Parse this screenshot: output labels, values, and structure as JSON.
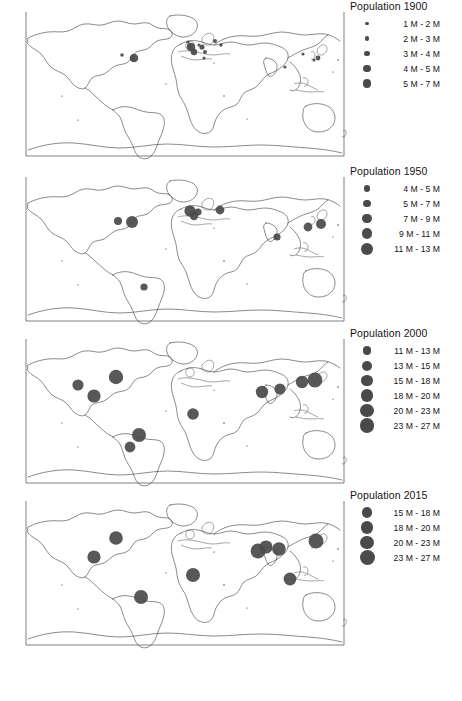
{
  "figure": {
    "type": "proportional-symbol-map-series",
    "panel_count": 4,
    "projection": "world-outline"
  },
  "panels": [
    {
      "id": "panel-1900",
      "legend": {
        "title": "Population 1900",
        "classes": [
          {
            "label": "1 M - 2 M",
            "radius_px": 1.6,
            "min_millions": 1,
            "max_millions": 2
          },
          {
            "label": "2 M - 3 M",
            "radius_px": 2.2,
            "min_millions": 2,
            "max_millions": 3
          },
          {
            "label": "3 M - 4 M",
            "radius_px": 2.9,
            "min_millions": 3,
            "max_millions": 4
          },
          {
            "label": "4 M - 5 M",
            "radius_px": 3.6,
            "min_millions": 4,
            "max_millions": 5
          },
          {
            "label": "5 M - 7 M",
            "radius_px": 4.3,
            "min_millions": 5,
            "max_millions": 7
          }
        ]
      },
      "cities": [
        {
          "name": "New York",
          "x": 116,
          "y": 58,
          "r": 4.3
        },
        {
          "name": "Chicago",
          "x": 104,
          "y": 55,
          "r": 1.8
        },
        {
          "name": "Philadelphia",
          "x": 114,
          "y": 59,
          "r": 1.8
        },
        {
          "name": "London",
          "x": 173,
          "y": 47,
          "r": 4.3
        },
        {
          "name": "Paris",
          "x": 176,
          "y": 52,
          "r": 3.2
        },
        {
          "name": "Berlin",
          "x": 184,
          "y": 47,
          "r": 2.6
        },
        {
          "name": "Vienna",
          "x": 187,
          "y": 52,
          "r": 2.0
        },
        {
          "name": "Saint Petersburg",
          "x": 197,
          "y": 41,
          "r": 2.0
        },
        {
          "name": "Moscow",
          "x": 203,
          "y": 45,
          "r": 1.7
        },
        {
          "name": "Manchester",
          "x": 171,
          "y": 45,
          "r": 1.6
        },
        {
          "name": "Birmingham",
          "x": 172,
          "y": 47,
          "r": 1.6
        },
        {
          "name": "Glasgow",
          "x": 170,
          "y": 42,
          "r": 1.6
        },
        {
          "name": "Hamburg",
          "x": 181,
          "y": 45,
          "r": 1.6
        },
        {
          "name": "Naples",
          "x": 186,
          "y": 58,
          "r": 1.6
        },
        {
          "name": "Tokyo",
          "x": 300,
          "y": 58,
          "r": 2.4
        },
        {
          "name": "Osaka",
          "x": 296,
          "y": 60,
          "r": 1.6
        },
        {
          "name": "Beijing",
          "x": 285,
          "y": 54,
          "r": 1.6
        },
        {
          "name": "Calcutta",
          "x": 267,
          "y": 67,
          "r": 1.6
        }
      ]
    },
    {
      "id": "panel-1950",
      "legend": {
        "title": "Population 1950",
        "classes": [
          {
            "label": "4 M - 5 M",
            "radius_px": 3.2,
            "min_millions": 4,
            "max_millions": 5
          },
          {
            "label": "5 M - 7 M",
            "radius_px": 3.9,
            "min_millions": 5,
            "max_millions": 7
          },
          {
            "label": "7 M - 9 M",
            "radius_px": 4.6,
            "min_millions": 7,
            "max_millions": 9
          },
          {
            "label": "9 M - 11 M",
            "radius_px": 5.3,
            "min_millions": 9,
            "max_millions": 11
          },
          {
            "label": "11 M - 13 M",
            "radius_px": 6.0,
            "min_millions": 11,
            "max_millions": 13
          }
        ]
      },
      "cities": [
        {
          "name": "New York",
          "x": 114,
          "y": 57,
          "r": 6.0
        },
        {
          "name": "Chicago",
          "x": 100,
          "y": 56,
          "r": 4.0
        },
        {
          "name": "London",
          "x": 172,
          "y": 46,
          "r": 5.6
        },
        {
          "name": "Paris",
          "x": 176,
          "y": 51,
          "r": 4.2
        },
        {
          "name": "Essen",
          "x": 180,
          "y": 47,
          "r": 3.6
        },
        {
          "name": "Moscow",
          "x": 202,
          "y": 45,
          "r": 4.4
        },
        {
          "name": "Mumbai",
          "x": 259,
          "y": 72,
          "r": 3.6
        },
        {
          "name": "Shanghai",
          "x": 290,
          "y": 62,
          "r": 4.4
        },
        {
          "name": "Tokyo",
          "x": 303,
          "y": 59,
          "r": 5.0
        },
        {
          "name": "Buenos Aires",
          "x": 126,
          "y": 122,
          "r": 3.6
        }
      ]
    },
    {
      "id": "panel-2000",
      "legend": {
        "title": "Population 2000",
        "classes": [
          {
            "label": "11 M - 13 M",
            "radius_px": 4.4,
            "min_millions": 11,
            "max_millions": 13
          },
          {
            "label": "13 M - 15 M",
            "radius_px": 5.0,
            "min_millions": 13,
            "max_millions": 15
          },
          {
            "label": "15 M - 18 M",
            "radius_px": 5.6,
            "min_millions": 15,
            "max_millions": 18
          },
          {
            "label": "18 M - 20 M",
            "radius_px": 6.2,
            "min_millions": 18,
            "max_millions": 20
          },
          {
            "label": "20 M - 23 M",
            "radius_px": 6.8,
            "min_millions": 20,
            "max_millions": 23
          },
          {
            "label": "23 M - 27 M",
            "radius_px": 7.4,
            "min_millions": 23,
            "max_millions": 27
          }
        ]
      },
      "cities": [
        {
          "name": "Los Angeles",
          "x": 60,
          "y": 58,
          "r": 5.6
        },
        {
          "name": "Mexico City",
          "x": 76,
          "y": 69,
          "r": 6.6
        },
        {
          "name": "New York",
          "x": 98,
          "y": 50,
          "r": 7.2
        },
        {
          "name": "Sao Paulo",
          "x": 121,
          "y": 108,
          "r": 7.0
        },
        {
          "name": "Buenos Aires",
          "x": 112,
          "y": 120,
          "r": 5.4
        },
        {
          "name": "Lagos",
          "x": 175,
          "y": 87,
          "r": 5.8
        },
        {
          "name": "Mumbai",
          "x": 244,
          "y": 65,
          "r": 6.2
        },
        {
          "name": "Delhi",
          "x": 262,
          "y": 62,
          "r": 5.6
        },
        {
          "name": "Shanghai",
          "x": 284,
          "y": 55,
          "r": 6.2
        },
        {
          "name": "Tokyo",
          "x": 297,
          "y": 53,
          "r": 7.4
        }
      ]
    },
    {
      "id": "panel-2015",
      "legend": {
        "title": "Population 2015",
        "classes": [
          {
            "label": "15 M - 18 M",
            "radius_px": 5.4,
            "min_millions": 15,
            "max_millions": 18
          },
          {
            "label": "18 M - 20 M",
            "radius_px": 6.1,
            "min_millions": 18,
            "max_millions": 20
          },
          {
            "label": "20 M - 23 M",
            "radius_px": 6.8,
            "min_millions": 20,
            "max_millions": 23
          },
          {
            "label": "23 M - 27 M",
            "radius_px": 7.5,
            "min_millions": 23,
            "max_millions": 27
          }
        ]
      },
      "cities": [
        {
          "name": "Mexico City",
          "x": 76,
          "y": 68,
          "r": 6.6
        },
        {
          "name": "New York",
          "x": 98,
          "y": 49,
          "r": 6.8
        },
        {
          "name": "Sao Paulo",
          "x": 123,
          "y": 108,
          "r": 7.0
        },
        {
          "name": "Lagos",
          "x": 175,
          "y": 86,
          "r": 7.0
        },
        {
          "name": "Mumbai",
          "x": 240,
          "y": 62,
          "r": 7.4
        },
        {
          "name": "Delhi",
          "x": 248,
          "y": 58,
          "r": 6.6
        },
        {
          "name": "Dhaka",
          "x": 261,
          "y": 60,
          "r": 6.8
        },
        {
          "name": "Manila",
          "x": 272,
          "y": 90,
          "r": 6.4
        },
        {
          "name": "Tokyo",
          "x": 298,
          "y": 52,
          "r": 7.5
        }
      ]
    }
  ],
  "style": {
    "dot_color": "#4a4a4a",
    "coast_color": "#2b2b2b",
    "background": "#ffffff",
    "text_color": "#141414"
  }
}
